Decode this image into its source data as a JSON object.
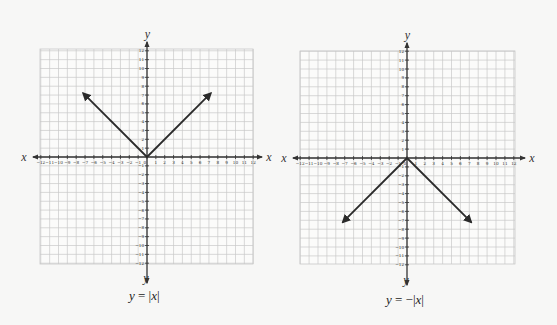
{
  "colors": {
    "background": "#f7f7f6",
    "grid": "#c8c8c8",
    "axis": "#333333",
    "curve": "#2a2a2a",
    "text": "#222222"
  },
  "chart_data": [
    {
      "type": "line",
      "title": "y = |x|",
      "xlabel": "x",
      "ylabel": "y",
      "xlim": [
        -12,
        12
      ],
      "ylim": [
        -12,
        12
      ],
      "grid": true,
      "x_ticks": [
        -12,
        -11,
        -10,
        -9,
        -8,
        -7,
        -6,
        -5,
        -4,
        -3,
        -2,
        -1,
        0,
        1,
        2,
        3,
        4,
        5,
        6,
        7,
        8,
        9,
        10,
        11,
        12
      ],
      "y_ticks": [
        -12,
        -11,
        -10,
        -9,
        -8,
        -7,
        -6,
        -5,
        -4,
        -3,
        -2,
        -1,
        1,
        2,
        3,
        4,
        5,
        6,
        7,
        8,
        9,
        10,
        11,
        12
      ],
      "series": [
        {
          "name": "y = |x|",
          "x": [
            -7,
            0,
            7
          ],
          "y": [
            7,
            0,
            7
          ],
          "arrows": "both-ends"
        }
      ]
    },
    {
      "type": "line",
      "title": "y = -|x|",
      "xlabel": "x",
      "ylabel": "y",
      "xlim": [
        -12,
        12
      ],
      "ylim": [
        -12,
        12
      ],
      "grid": true,
      "x_ticks": [
        -12,
        -11,
        -10,
        -9,
        -8,
        -7,
        -6,
        -5,
        -4,
        -3,
        -2,
        -1,
        0,
        1,
        2,
        3,
        4,
        5,
        6,
        7,
        8,
        9,
        10,
        11,
        12
      ],
      "y_ticks": [
        -12,
        -11,
        -10,
        -9,
        -8,
        -7,
        -6,
        -5,
        -4,
        -3,
        -2,
        -1,
        1,
        2,
        3,
        4,
        5,
        6,
        7,
        8,
        9,
        10,
        11,
        12
      ],
      "series": [
        {
          "name": "y = -|x|",
          "x": [
            -7,
            0,
            7
          ],
          "y": [
            -7,
            0,
            -7
          ],
          "arrows": "both-ends"
        }
      ]
    }
  ],
  "graphs": [
    {
      "caption_y": "y",
      "caption_eq": " = |",
      "caption_x": "x",
      "caption_end": "|",
      "axis_label_x": "x",
      "axis_label_y": "y",
      "layout": {
        "ox": 147,
        "oy": 157,
        "unit": 8.85,
        "grid_left": 40,
        "grid_right": 253,
        "grid_top": 49,
        "grid_bottom": 264,
        "x_arrow_left": 33,
        "x_arrow_right": 262,
        "y_arrow_top": 42,
        "y_arrow_bottom": 283,
        "caption_left": 129,
        "caption_top": 288
      }
    },
    {
      "caption_y": "y",
      "caption_eq": " = −|",
      "caption_x": "x",
      "caption_end": "|",
      "axis_label_x": "x",
      "axis_label_y": "y",
      "layout": {
        "ox": 407,
        "oy": 158,
        "unit": 8.9,
        "grid_left": 300,
        "grid_right": 515,
        "grid_top": 51,
        "grid_bottom": 264,
        "x_arrow_left": 293,
        "x_arrow_right": 525,
        "y_arrow_top": 43,
        "y_arrow_bottom": 285,
        "caption_left": 386,
        "caption_top": 292
      }
    }
  ]
}
